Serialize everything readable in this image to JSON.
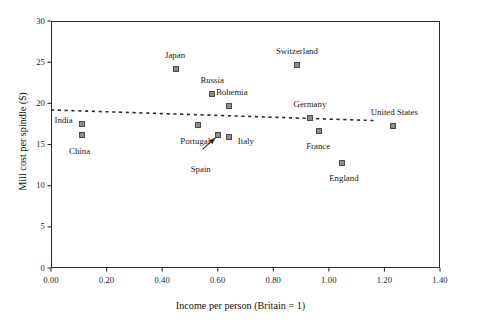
{
  "chart_data": {
    "type": "scatter",
    "title": "",
    "xlabel": "Income per person (Britain = 1)",
    "ylabel": "Mill cost per spindle ($)",
    "xlim": [
      0.0,
      1.4
    ],
    "ylim": [
      0,
      30
    ],
    "xticks": [
      "0.00",
      "0.20",
      "0.40",
      "0.60",
      "0.80",
      "1.00",
      "1.20",
      "1.40"
    ],
    "xtick_values": [
      0.0,
      0.2,
      0.4,
      0.6,
      0.8,
      1.0,
      1.2,
      1.4
    ],
    "yticks": [
      "0",
      "5",
      "10",
      "15",
      "20",
      "25",
      "30"
    ],
    "ytick_values": [
      0,
      5,
      10,
      15,
      20,
      25,
      30
    ],
    "grid": false,
    "legend": "none",
    "marker_color": "#8c8c8c",
    "marker_edge_color": "#4a4a4a",
    "trendline_color": "#2b2b2b",
    "points": [
      {
        "label": "India",
        "x": 0.11,
        "y": 17.5,
        "label_dx": -27,
        "label_dy": -4
      },
      {
        "label": "China",
        "x": 0.11,
        "y": 16.1,
        "label_dx": -2,
        "label_dy": 16
      },
      {
        "label": "Japan",
        "x": 0.45,
        "y": 24.2,
        "label_dx": -1,
        "label_dy": -14
      },
      {
        "label": "Russia",
        "x": 0.58,
        "y": 21.1,
        "label_dx": 0,
        "label_dy": -14
      },
      {
        "label": "Bohemia",
        "x": 0.64,
        "y": 19.7,
        "label_dx": 3,
        "label_dy": -14
      },
      {
        "label": "Portugal",
        "x": 0.53,
        "y": 17.4,
        "label_dx": -3,
        "label_dy": 16
      },
      {
        "label": "Spain",
        "x": 0.6,
        "y": 16.2,
        "label_dx": -27,
        "label_dy": 34
      },
      {
        "label": "Italy",
        "x": 0.64,
        "y": 15.9,
        "label_dx": 9,
        "label_dy": 4
      },
      {
        "label": "Switzerland",
        "x": 0.885,
        "y": 24.7,
        "label_dx": 0,
        "label_dy": -14
      },
      {
        "label": "Germany",
        "x": 0.932,
        "y": 18.2,
        "label_dx": 0,
        "label_dy": -14
      },
      {
        "label": "France",
        "x": 0.965,
        "y": 16.6,
        "label_dx": -1,
        "label_dy": 15
      },
      {
        "label": "England",
        "x": 1.047,
        "y": 12.8,
        "label_dx": 2,
        "label_dy": 15
      },
      {
        "label": "United States",
        "x": 1.232,
        "y": 17.3,
        "label_dx": 1,
        "label_dy": -14
      }
    ],
    "trendline": {
      "style": "dotted",
      "x_start": 0.0,
      "y_start": 19.2,
      "x_end": 1.17,
      "y_end": 17.9
    },
    "annotation_arrow": {
      "from_label": "Spain",
      "tail_x": 0.545,
      "tail_y": 14.4,
      "head_x": 0.592,
      "head_y": 15.8
    }
  }
}
